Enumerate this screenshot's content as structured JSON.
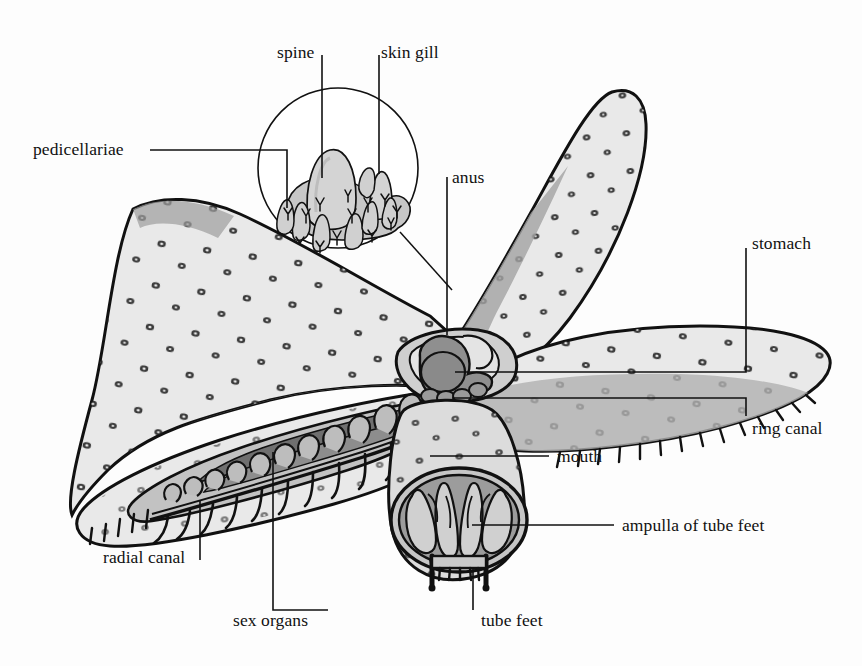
{
  "figure": {
    "background": "#fdfdfd",
    "palette": {
      "ink": "#111111",
      "body_light": "#e9e9e9",
      "body_mid": "#c9c9c9",
      "shade_mid": "#9a9a9a",
      "shade_dark": "#6f6f6f",
      "shade_darkest": "#4a4a4a",
      "inset_fill": "#d6d6d6"
    }
  },
  "labels": [
    {
      "id": "spine",
      "text": "spine",
      "x": 277,
      "y": 44,
      "leader": "vertical-down"
    },
    {
      "id": "skin_gill",
      "text": "skin gill",
      "x": 381,
      "y": 44,
      "leader": "vertical-down"
    },
    {
      "id": "pedicellariae",
      "text": "pedicellariae",
      "x": 33,
      "y": 143,
      "leader": "horizontal-right-then-down"
    },
    {
      "id": "anus",
      "text": "anus",
      "x": 452,
      "y": 171,
      "leader": "vertical-down"
    },
    {
      "id": "stomach",
      "text": "stomach",
      "x": 750,
      "y": 236,
      "leader": "down-then-left"
    },
    {
      "id": "ring_canal",
      "text": "ring canal",
      "x": 750,
      "y": 423,
      "leader": "up-then-left"
    },
    {
      "id": "mouth",
      "text": "mouth",
      "x": 557,
      "y": 452,
      "leader": "left"
    },
    {
      "id": "ampulla",
      "text": "ampulla of tube feet",
      "x": 622,
      "y": 521,
      "leader": "left"
    },
    {
      "id": "radial_canal",
      "text": "radial canal",
      "x": 103,
      "y": 551,
      "leader": "tick-right-up"
    },
    {
      "id": "sex_organs",
      "text": "sex organs",
      "x": 233,
      "y": 615,
      "leader": "right-then-up"
    },
    {
      "id": "tube_feet",
      "text": "tube feet",
      "x": 481,
      "y": 615,
      "leader": "tick-left-up"
    }
  ],
  "parts": {
    "arms": [
      {
        "name": "upper-left-arm",
        "note": "aboral surface with spine bases"
      },
      {
        "name": "upper-right-arm",
        "note": "aboral surface with spine bases"
      },
      {
        "name": "right-arm",
        "note": "aboral surface, tube feet fringe below"
      },
      {
        "name": "lower-left-arm",
        "note": "cutaway showing ampullae, radial canal, tube feet"
      },
      {
        "name": "central-disc",
        "note": "oral disc with mouth opening"
      }
    ],
    "inset": {
      "name": "magnified-skin-detail",
      "contents": [
        "spine",
        "skin gill",
        "pedicellariae"
      ]
    },
    "internal": [
      "stomach",
      "ring canal",
      "radial canal",
      "ampulla of tube feet",
      "sex organs",
      "anus",
      "mouth",
      "tube feet"
    ]
  }
}
